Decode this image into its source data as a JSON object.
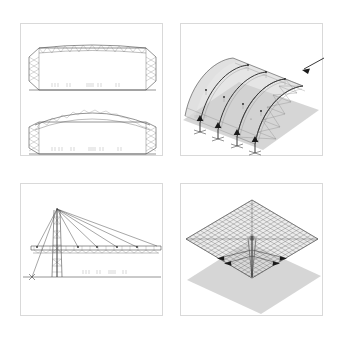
{
  "sheet": {
    "title": "Structural systems plate",
    "background_color": "#ffffff",
    "panel_border_color": "#d9d9d9",
    "line_color": "#3a3a3a",
    "surface_color": "#cfcfcf",
    "shadow_color": "#b4b4b4"
  },
  "panels": [
    {
      "id": "elevations",
      "name": "truss-elevations",
      "position": "top-left",
      "figures": [
        {
          "name": "flat-top-truss-elevation",
          "type": "elevation",
          "description": "Rectangular hall frame with shallow triangulated top chord truss and vertical lattice end walls",
          "top_chord": "shallow-cambered",
          "web_pattern": "warren-zigzag",
          "end_walls": "vertical-lattice-x",
          "dimension_marks": "|| ||   ||    |||| ||      ||"
        },
        {
          "name": "arched-top-truss-elevation",
          "type": "elevation",
          "description": "Hall frame with pronounced arched top chord truss and vertical lattice end walls",
          "top_chord": "arched",
          "web_pattern": "warren-zigzag",
          "end_walls": "vertical-lattice-x",
          "dimension_marks": "|| ||   ||    |||| ||      ||"
        }
      ]
    },
    {
      "id": "axono-vault",
      "name": "barrel-vault-axonometric",
      "position": "top-right",
      "figures": [
        {
          "name": "barrel-vault-structure",
          "type": "axonometric",
          "description": "Barrel vault roof on four transverse arch ribs with longitudinal ridge beam, braced gable end bay and ground shadow",
          "arch_ribs": 4,
          "end_bay_bracing": "x-braced-lattice-panel",
          "supports": "pinned-base-anchors",
          "annotation_arrow": "points-to-braced-end-bay",
          "dimension_marks": "||| ||"
        }
      ]
    },
    {
      "id": "cable-stay",
      "name": "cable-stayed-roof-elevation",
      "position": "bottom-left",
      "figures": [
        {
          "name": "cable-stayed-mast-and-deck",
          "type": "elevation",
          "description": "Lattice mast with fan of stay cables supporting a long horizontal truss deck, back-stay anchored to ground at left",
          "mast": "lattice-column",
          "stay_cables_forward": 5,
          "stay_cables_back": 2,
          "deck": "horizontal-triangulated-truss",
          "ground_line": true,
          "dimension_marks": "||| || |||| ||"
        }
      ]
    },
    {
      "id": "grid-shell",
      "name": "space-frame-grid-axonometric",
      "position": "bottom-right",
      "figures": [
        {
          "name": "square-space-frame-on-central-column",
          "type": "axonometric",
          "description": "Square double-layer space frame grid carried on a single central tapered column with radiating diagonal struts, cast shadow on ground plane",
          "grid_divisions": 18,
          "support": "single-central-column",
          "radiating_struts": 4,
          "shadow": "ground-plane-shadow"
        }
      ]
    }
  ]
}
